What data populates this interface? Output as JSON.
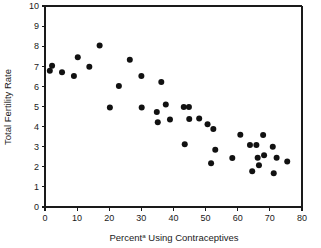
{
  "chart_data": {
    "type": "scatter",
    "title": "",
    "xlabel": "Percentª Using Contraceptives",
    "xlabel_main": "Percent",
    "xlabel_superscript": "a",
    "xlabel_rest": " Using Contraceptives",
    "ylabel": "Total Fertility Rate",
    "xlim": [
      0,
      80
    ],
    "ylim": [
      0,
      10
    ],
    "xticks": [
      0,
      10,
      20,
      30,
      40,
      50,
      60,
      70,
      80
    ],
    "xtick_labels": [
      "0",
      "10",
      "20",
      "30",
      "40",
      "50",
      "60",
      "70",
      "80"
    ],
    "yticks": [
      0,
      1,
      2,
      3,
      4,
      5,
      6,
      7,
      8,
      9,
      10
    ],
    "ytick_labels": [
      "0",
      "1",
      "2",
      "3",
      "4",
      "5",
      "6",
      "7",
      "8",
      "9",
      "10"
    ],
    "grid": false,
    "legend": false,
    "marker": "circle",
    "marker_color": "#111111",
    "marker_size": 3.0,
    "points": [
      {
        "x": 1.5,
        "y": 6.78
      },
      {
        "x": 2.2,
        "y": 7.03
      },
      {
        "x": 5.3,
        "y": 6.7
      },
      {
        "x": 9.0,
        "y": 6.52
      },
      {
        "x": 10.2,
        "y": 7.45
      },
      {
        "x": 13.8,
        "y": 6.98
      },
      {
        "x": 17.0,
        "y": 8.03
      },
      {
        "x": 20.2,
        "y": 4.95
      },
      {
        "x": 23.0,
        "y": 6.02
      },
      {
        "x": 26.4,
        "y": 7.32
      },
      {
        "x": 30.0,
        "y": 6.52
      },
      {
        "x": 30.1,
        "y": 4.95
      },
      {
        "x": 34.8,
        "y": 4.73
      },
      {
        "x": 35.1,
        "y": 4.22
      },
      {
        "x": 36.2,
        "y": 6.22
      },
      {
        "x": 37.6,
        "y": 5.1
      },
      {
        "x": 38.9,
        "y": 4.35
      },
      {
        "x": 43.2,
        "y": 4.98
      },
      {
        "x": 43.5,
        "y": 3.12
      },
      {
        "x": 44.8,
        "y": 4.98
      },
      {
        "x": 44.9,
        "y": 4.38
      },
      {
        "x": 48.0,
        "y": 4.4
      },
      {
        "x": 50.6,
        "y": 4.12
      },
      {
        "x": 51.7,
        "y": 2.18
      },
      {
        "x": 52.4,
        "y": 3.88
      },
      {
        "x": 53.0,
        "y": 2.85
      },
      {
        "x": 58.3,
        "y": 2.44
      },
      {
        "x": 60.8,
        "y": 3.6
      },
      {
        "x": 63.8,
        "y": 3.08
      },
      {
        "x": 64.5,
        "y": 1.78
      },
      {
        "x": 65.8,
        "y": 3.08
      },
      {
        "x": 66.2,
        "y": 2.45
      },
      {
        "x": 66.6,
        "y": 2.08
      },
      {
        "x": 67.9,
        "y": 3.58
      },
      {
        "x": 68.2,
        "y": 2.58
      },
      {
        "x": 70.9,
        "y": 3.0
      },
      {
        "x": 71.2,
        "y": 1.68
      },
      {
        "x": 72.1,
        "y": 2.45
      },
      {
        "x": 75.4,
        "y": 2.26
      }
    ]
  }
}
